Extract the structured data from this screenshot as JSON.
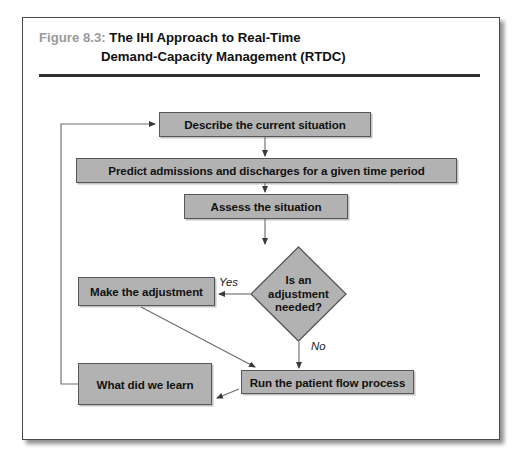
{
  "figure": {
    "number_label": "Figure 8.3:",
    "title_line1": "The IHI Approach to Real-Time",
    "title_line2": "Demand-Capacity Management (RTDC)"
  },
  "colors": {
    "node_fill": "#b2b2b2",
    "node_border": "#55585a",
    "frame_border": "#4a4a4a",
    "rule": "#2f2f2f",
    "figure_number": "#9a9a9a",
    "text": "#111111",
    "page_background": "#ffffff"
  },
  "diagram": {
    "type": "flowchart",
    "nodes": [
      {
        "id": "describe",
        "label": "Describe the current situation",
        "shape": "rectangle"
      },
      {
        "id": "predict",
        "label": "Predict admissions and discharges for a given time period",
        "shape": "rectangle"
      },
      {
        "id": "assess",
        "label": "Assess the situation",
        "shape": "rectangle"
      },
      {
        "id": "decision",
        "label_line1": "Is an",
        "label_line2": "adjustment",
        "label_line3": "needed?",
        "shape": "diamond"
      },
      {
        "id": "make_adjustment",
        "label": "Make the adjustment",
        "shape": "rectangle"
      },
      {
        "id": "what_learn",
        "label": "What did we learn",
        "shape": "rectangle"
      },
      {
        "id": "run_flow",
        "label": "Run the patient flow process",
        "shape": "rectangle"
      }
    ],
    "edges": [
      {
        "from": "describe",
        "to": "predict",
        "label": ""
      },
      {
        "from": "predict",
        "to": "assess",
        "label": ""
      },
      {
        "from": "assess",
        "to": "decision",
        "label": ""
      },
      {
        "from": "decision",
        "to": "make_adjustment",
        "label": "Yes"
      },
      {
        "from": "decision",
        "to": "run_flow",
        "label": "No"
      },
      {
        "from": "make_adjustment",
        "to": "run_flow",
        "label": ""
      },
      {
        "from": "run_flow",
        "to": "what_learn",
        "label": ""
      },
      {
        "from": "what_learn",
        "to": "describe",
        "label": ""
      }
    ],
    "edge_labels": {
      "yes": "Yes",
      "no": "No"
    }
  }
}
